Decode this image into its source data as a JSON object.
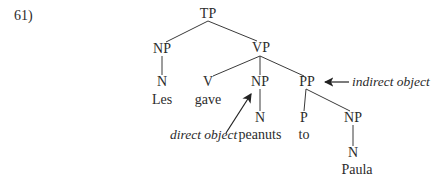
{
  "example_number": "61)",
  "tree": {
    "nodes": {
      "tp": "TP",
      "np_subj": "NP",
      "n_subj": "N",
      "les": "Les",
      "vp": "VP",
      "v": "V",
      "gave": "gave",
      "np_obj": "NP",
      "n_obj": "N",
      "peanuts": "peanuts",
      "pp": "PP",
      "p": "P",
      "to": "to",
      "np_ind": "NP",
      "n_ind": "N",
      "paula": "Paula"
    }
  },
  "annotations": {
    "direct_object": "direct object",
    "indirect_object": "indirect object"
  },
  "colors": {
    "line": "#3a3a3a",
    "text": "#2b2b2b"
  }
}
